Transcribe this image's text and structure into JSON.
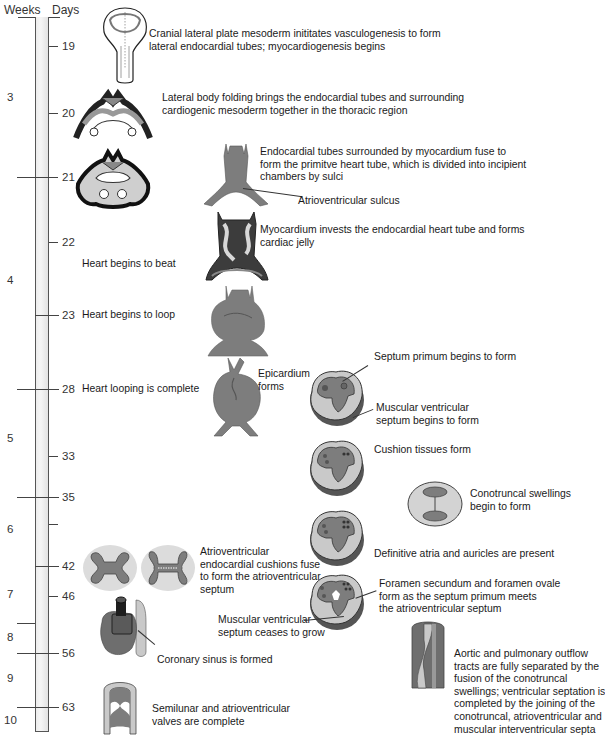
{
  "headers": {
    "weeks": "Weeks",
    "days": "Days"
  },
  "timeline": {
    "weeks": [
      {
        "label": "3",
        "y": 97
      },
      {
        "label": "4",
        "y": 280
      },
      {
        "label": "5",
        "y": 438
      },
      {
        "label": "6",
        "y": 529
      },
      {
        "label": "7",
        "y": 594
      },
      {
        "label": "8",
        "y": 637
      },
      {
        "label": "9",
        "y": 678
      },
      {
        "label": "10",
        "y": 720
      }
    ],
    "week_boundaries": [
      177,
      389,
      497,
      623,
      653,
      707
    ],
    "days": [
      {
        "label": "19",
        "y": 46
      },
      {
        "label": "20",
        "y": 113
      },
      {
        "label": "21",
        "y": 177
      },
      {
        "label": "22",
        "y": 242
      },
      {
        "label": "23",
        "y": 315
      },
      {
        "label": "28",
        "y": 389
      },
      {
        "label": "33",
        "y": 456
      },
      {
        "label": "35",
        "y": 497
      },
      {
        "label": "",
        "y": 524
      },
      {
        "label": "42",
        "y": 566
      },
      {
        "label": "46",
        "y": 596
      },
      {
        "label": "56",
        "y": 653
      },
      {
        "label": "63",
        "y": 707
      }
    ]
  },
  "captions": {
    "day19": [
      "Cranial lateral plate mesoderm inititates vasculogenesis to form",
      "lateral endocardial tubes; myocardiogenesis begins"
    ],
    "day20": [
      "Lateral body folding brings the endocardial tubes and surrounding",
      "cardiogenic mesoderm together in the thoracic region"
    ],
    "day21": [
      "Endocardial tubes surrounded by myocardium fuse to",
      "form the primitve heart tube, which is divided into incipient",
      "chambers by sulci"
    ],
    "av_sulcus": "Atrioventricular sulcus",
    "day22_myocardium": [
      "Myocardium invests the endocardial heart tube and forms",
      "cardiac jelly"
    ],
    "heart_beat": "Heart begins to beat",
    "heart_loop": "Heart begins to loop",
    "loop_complete": "Heart looping is complete",
    "epicardium": [
      "Epicardium",
      "forms"
    ],
    "septum_primum": "Septum primum begins to form",
    "muscular_vs_begins": [
      "Muscular ventricular",
      "septum begins to form"
    ],
    "cushion": "Cushion tissues form",
    "conotruncal": [
      "Conotruncal swellings",
      "begin to form"
    ],
    "definitive_atria": "Definitive atria and auricles are present",
    "av_cushions": [
      "Atrioventricular",
      "endocardial cushions fuse",
      "to form the atrioventricular",
      "septum"
    ],
    "foramen": [
      "Foramen secundum and foramen ovale",
      "form as the septum primum meets",
      "the atrioventricular septum"
    ],
    "muscular_vs_ceases": [
      "Muscular ventricular",
      "septum ceases to grow"
    ],
    "coronary": "Coronary sinus is formed",
    "outflow": [
      "Aortic and pulmonary outflow",
      "tracts are fully separated by the",
      "fusion of the conotruncal",
      "swellings; ventricular septation is",
      "completed by the joining of the",
      "conotruncal, atrioventricular and",
      "muscular interventricular septa"
    ],
    "valves": [
      "Semilunar and atrioventricular",
      "valves are complete"
    ]
  },
  "colors": {
    "myocardium": "#7d7d7d",
    "light_tissue": "#c9c9c9",
    "cushion_halo": "#dcdcdc",
    "dark": "#1c1c1c",
    "timeline_bar": "#ececec"
  }
}
